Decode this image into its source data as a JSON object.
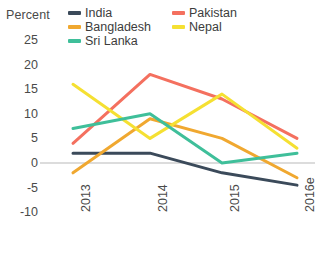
{
  "chart_data": {
    "type": "line",
    "title": "",
    "ylabel": "Percent",
    "xlabel": "",
    "categories": [
      "2013",
      "2014",
      "2015",
      "2016e"
    ],
    "ylim": [
      -10,
      25
    ],
    "yticks": [
      25,
      20,
      15,
      10,
      5,
      0,
      -5,
      -10
    ],
    "grid": false,
    "zero_line": true,
    "legend_position": "top",
    "series": [
      {
        "name": "India",
        "color": "#3b4a5a",
        "values": [
          2,
          2,
          -2,
          -4.5
        ]
      },
      {
        "name": "Pakistan",
        "color": "#f4705f",
        "values": [
          4,
          18,
          13,
          5
        ]
      },
      {
        "name": "Bangladesh",
        "color": "#f0a830",
        "values": [
          -2,
          9,
          5,
          -3
        ]
      },
      {
        "name": "Nepal",
        "color": "#f5e032",
        "values": [
          16,
          5,
          14,
          3
        ]
      },
      {
        "name": "Sri Lanka",
        "color": "#3fbf9a",
        "values": [
          7,
          10,
          0,
          2
        ]
      }
    ]
  },
  "axis": {
    "unit_label": "Percent"
  },
  "legend": {
    "rows": [
      {
        "left": {
          "label": "India",
          "swatch": "legend-swatch-india"
        },
        "right": {
          "label": "Pakistan",
          "swatch": "legend-swatch-pakistan"
        }
      },
      {
        "left": {
          "label": "Bangladesh",
          "swatch": "legend-swatch-bangladesh"
        },
        "right": {
          "label": "Nepal",
          "swatch": "legend-swatch-nepal"
        }
      },
      {
        "left": {
          "label": "Sri Lanka",
          "swatch": "legend-swatch-srilanka"
        },
        "right": {
          "label": "",
          "swatch": ""
        }
      }
    ]
  }
}
